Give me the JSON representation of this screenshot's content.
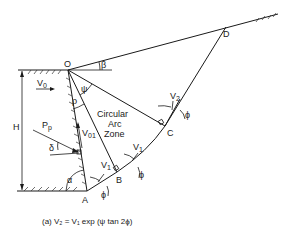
{
  "diagram": {
    "points": {
      "O": "O",
      "A": "A",
      "B": "B",
      "C": "C",
      "D": "D"
    },
    "zone_label": [
      "Circular",
      "Arc",
      "Zone"
    ],
    "symbols": {
      "H": "H",
      "V0": "V",
      "V0_sub": "0",
      "V01": "V",
      "V01_sub": "01",
      "Pp": "P",
      "Pp_sub": "p",
      "delta": "δ",
      "alpha": "α",
      "beta": "β",
      "psi": "ψ",
      "rho": "ρ",
      "phi_A": "ϕ",
      "phi_B": "ϕ",
      "phi_C": "ϕ",
      "V1_A": "V",
      "V1_A_sub": "1",
      "V1_B": "V",
      "V1_B_sub": "1",
      "V2": "V",
      "V2_sub": "2"
    },
    "caption": "(a)  V₂ = V₁ exp (ψ tan 2ϕ)"
  }
}
